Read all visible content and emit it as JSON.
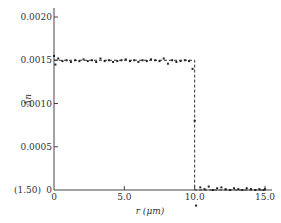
{
  "chart_data": {
    "type": "line",
    "title": "",
    "xlabel": "r (μm)",
    "ylabel": "Δn",
    "xlim": [
      0,
      15.5
    ],
    "ylim": [
      0,
      0.0021
    ],
    "grid": false,
    "legend": null,
    "x_ticks": [
      {
        "value": 0,
        "label": "0"
      },
      {
        "value": 5.0,
        "label": "5.0"
      },
      {
        "value": 10.0,
        "label": "10.0"
      },
      {
        "value": 15.0,
        "label": "15.0"
      }
    ],
    "y_ticks": [
      {
        "value": 0,
        "label": "0"
      },
      {
        "value": 0.0005,
        "label": "0.0005"
      },
      {
        "value": 0.001,
        "label": "0.0010"
      },
      {
        "value": 0.0015,
        "label": "0.0015"
      },
      {
        "value": 0.002,
        "label": "0.0020"
      }
    ],
    "y_origin_annotation": "(1.50)",
    "series": [
      {
        "name": "step-index profile (dashed)",
        "style": "dashed",
        "x": [
          0,
          10.0,
          10.0,
          15.0
        ],
        "y": [
          0.0015,
          0.0015,
          0,
          0
        ]
      },
      {
        "name": "measured points",
        "style": "scatter",
        "x": [
          0.0,
          0.1,
          0.3,
          0.6,
          0.9,
          1.2,
          1.5,
          1.8,
          2.1,
          2.4,
          2.7,
          3.0,
          3.3,
          3.6,
          3.9,
          4.2,
          4.5,
          4.8,
          5.1,
          5.4,
          5.7,
          6.0,
          6.3,
          6.6,
          6.9,
          7.2,
          7.5,
          7.8,
          8.1,
          8.4,
          8.7,
          9.0,
          9.3,
          9.6,
          9.85,
          10.0,
          10.1,
          10.4,
          10.7,
          11.0,
          11.3,
          11.6,
          11.9,
          12.2,
          12.5,
          12.8,
          13.1,
          13.4,
          13.7,
          14.0,
          14.3,
          14.6,
          14.9,
          15.0
        ],
        "y": [
          0.00155,
          0.00145,
          0.00152,
          0.00149,
          0.0015,
          0.00148,
          0.0015,
          0.00149,
          0.00151,
          0.00149,
          0.0015,
          0.00148,
          0.00152,
          0.00149,
          0.0015,
          0.00148,
          0.00149,
          0.0015,
          0.00151,
          0.00149,
          0.0015,
          0.00148,
          0.0015,
          0.00149,
          0.00151,
          0.0015,
          0.00149,
          0.00152,
          0.00146,
          0.0015,
          0.00148,
          0.00149,
          0.0015,
          0.00149,
          0.0014,
          0.0008,
          -0.00018,
          3e-05,
          1e-05,
          4e-05,
          0.0,
          2e-05,
          3e-05,
          1e-05,
          0.0,
          2e-05,
          1e-05,
          0.0,
          2e-05,
          1e-05,
          0.0,
          1e-05,
          0.0,
          1e-05
        ]
      }
    ]
  }
}
